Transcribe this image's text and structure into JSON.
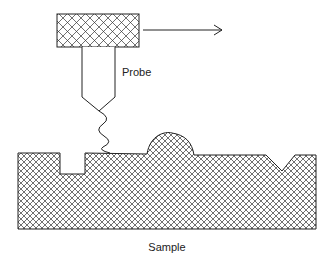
{
  "diagram": {
    "labels": {
      "probe": "Probe",
      "sample": "Sample"
    },
    "colors": {
      "stroke": "#222222",
      "background": "#ffffff",
      "hatch": "#333333"
    },
    "elements": {
      "probe_head": "cross-hatched holder block",
      "scan_arrow": "arrow pointing right (scan direction)",
      "probe_shaft": "tapered probe shaft",
      "spring": "zigzag spring linking tip to surface",
      "sample_body": "cross-hatched sample block",
      "features": [
        "rectangular notch",
        "rounded bump",
        "V-shaped groove"
      ]
    }
  }
}
